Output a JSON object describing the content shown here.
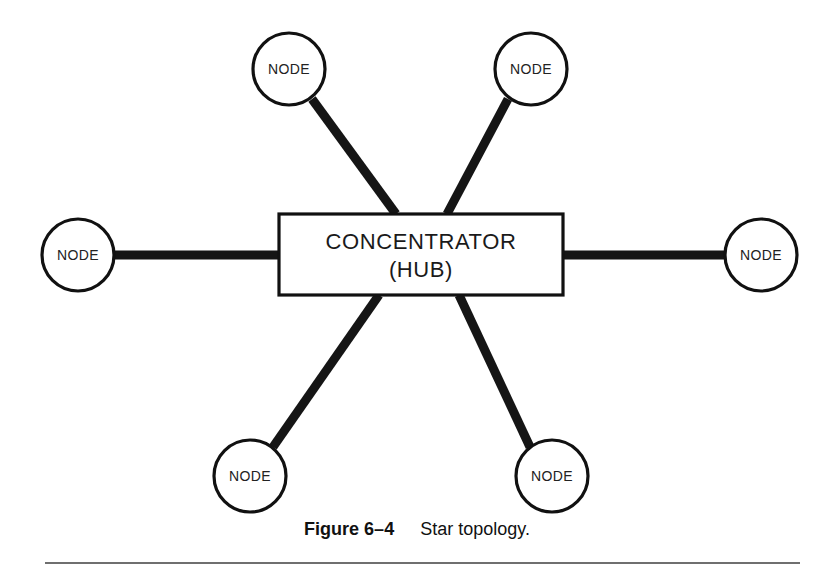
{
  "figure": {
    "caption_label": "Figure 6–4",
    "caption_title": "Star topology.",
    "background_color": "#ffffff",
    "line_color": "#151515",
    "stroke_color": "#111111",
    "rule_color": "#6f6f6f"
  },
  "hub": {
    "line1": "CONCENTRATOR",
    "line2": "(HUB)",
    "shape": "rectangle",
    "x": 279,
    "y": 214,
    "width": 284,
    "height": 81
  },
  "nodes": [
    {
      "label": "NODE",
      "position": "top-left",
      "cx": 289,
      "cy": 69,
      "r": 36
    },
    {
      "label": "NODE",
      "position": "top-right",
      "cx": 531,
      "cy": 69,
      "r": 36
    },
    {
      "label": "NODE",
      "position": "left",
      "cx": 78,
      "cy": 255,
      "r": 36
    },
    {
      "label": "NODE",
      "position": "right",
      "cx": 761,
      "cy": 255,
      "r": 36
    },
    {
      "label": "NODE",
      "position": "bottom-left",
      "cx": 250,
      "cy": 476,
      "r": 36
    },
    {
      "label": "NODE",
      "position": "bottom-right",
      "cx": 552,
      "cy": 476,
      "r": 36
    }
  ],
  "links": [
    {
      "from": "top-left",
      "to": "hub",
      "x1": 312,
      "y1": 99,
      "x2": 396,
      "y2": 214
    },
    {
      "from": "top-right",
      "to": "hub",
      "x1": 508,
      "y1": 99,
      "x2": 447,
      "y2": 214
    },
    {
      "from": "left",
      "to": "hub",
      "x1": 114,
      "y1": 255,
      "x2": 279,
      "y2": 255
    },
    {
      "from": "right",
      "to": "hub",
      "x1": 725,
      "y1": 255,
      "x2": 563,
      "y2": 255
    },
    {
      "from": "bottom-left",
      "to": "hub",
      "x1": 273,
      "y1": 447,
      "x2": 379,
      "y2": 295
    },
    {
      "from": "bottom-right",
      "to": "hub",
      "x1": 530,
      "y1": 447,
      "x2": 459,
      "y2": 295
    }
  ]
}
